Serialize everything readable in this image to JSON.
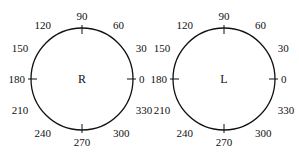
{
  "diagrams": [
    {
      "center_label": "R",
      "cx": 82,
      "cy": 79,
      "r": 51,
      "angle_labels": [
        "0",
        "30",
        "60",
        "90",
        "120",
        "150",
        "180",
        "210",
        "240",
        "270",
        "300",
        "330"
      ]
    },
    {
      "center_label": "L",
      "cx": 224,
      "cy": 79,
      "r": 51,
      "angle_labels": [
        "0",
        "30",
        "60",
        "90",
        "120",
        "150",
        "180",
        "210",
        "240",
        "270",
        "300",
        "330"
      ]
    }
  ],
  "stroke_color": "#111111"
}
